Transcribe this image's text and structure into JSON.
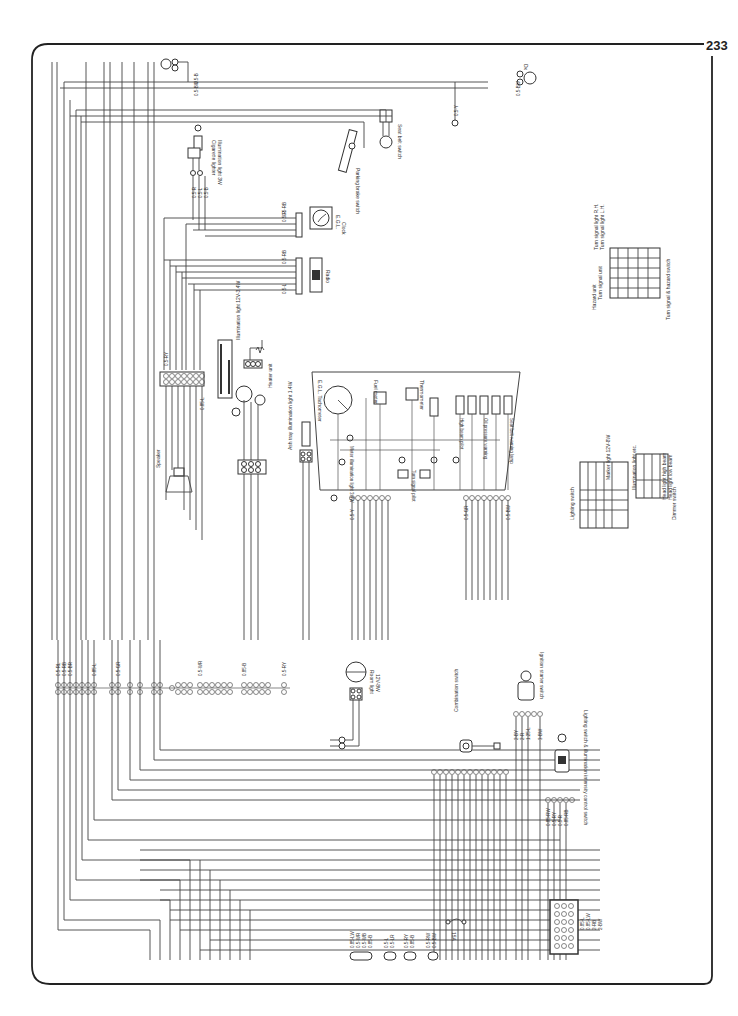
{
  "page": {
    "number": "233",
    "background": "#ffffff",
    "line_color": "#333333"
  },
  "components": {
    "cigarette_lighter": {
      "label": "Cigarette lighter",
      "sub": "Illumination light 3W"
    },
    "parking_brake": {
      "label": "Parking brake switch"
    },
    "seat_belt_switch": {
      "label": "Seat belt switch"
    },
    "door_switch": {
      "label": "Dx"
    },
    "clock": {
      "label": "Clock",
      "sub": "E.G.L."
    },
    "radio": {
      "label": "Radio"
    },
    "illumination_light": {
      "label": "Illumination light 12V-3.4W"
    },
    "heater_unit": {
      "label": "Heater unit"
    },
    "ash_tray": {
      "label": "Ash tray illumination light 1.4W"
    },
    "speaker": {
      "label": "Speaker"
    },
    "tachometer": {
      "label": "E.G.L. Tachometer"
    },
    "fuel_meter": {
      "label": "Fuel meter"
    },
    "thermometer": {
      "label": "Thermometer"
    },
    "meter_illumination": {
      "label": "Meter illumination light 3.4W"
    },
    "turn_signal_pilot": {
      "label": "Turn signal pilot"
    },
    "high_beam": {
      "label": "High beam pilot"
    },
    "oil_pressure": {
      "label": "Oil pressure warning"
    },
    "seat_belt_warning": {
      "label": "Seat belt warning lamp"
    },
    "room_light": {
      "label": "Room light",
      "sub": "12V-8W"
    },
    "combination_switch": {
      "label": "Combination switch"
    },
    "ignition_switch": {
      "label": "Ignition starter switch"
    },
    "lighting_switch": {
      "label": "Lighting switch & illumination intensity control switch"
    },
    "fuse": {
      "label": "15A"
    }
  },
  "tables": {
    "lighting_switch": {
      "title": "Lighting switch",
      "headers": [
        "Terminal",
        "B",
        "T",
        "H",
        "M",
        "L"
      ],
      "rows": [
        [
          "Color",
          "R/Y",
          "R",
          "RW",
          "RG",
          "LW"
        ],
        [
          "Pull OFF",
          "",
          "",
          "",
          "",
          ""
        ],
        [
          "ON",
          "",
          "",
          "",
          "",
          ""
        ]
      ],
      "notes": [
        "Marker light 12V-8W",
        "Illumination light etc."
      ]
    },
    "dimmer_switch": {
      "title": "Dimmer switch",
      "headers": [
        "Terminal",
        "RW",
        "RG",
        "RL"
      ],
      "rows": [
        [
          "Color",
          "",
          "",
          ""
        ],
        [
          "Lo",
          "",
          "",
          ""
        ],
        [
          "Hi",
          "",
          "",
          ""
        ]
      ],
      "notes": [
        "Head light high beam",
        "Head light low beam"
      ]
    },
    "turn_signal_hazard": {
      "title": "Turn signal & hazard switch",
      "headers": [
        "Terminal",
        "FU",
        "B",
        "FR",
        "FL"
      ],
      "rows": [
        [
          "Color",
          "GY",
          "GR",
          "GW",
          "GB"
        ],
        [
          "Turn signal R.H.",
          "",
          "",
          "",
          ""
        ],
        [
          "Turn signal L.H.",
          "",
          "",
          "",
          ""
        ],
        [
          "Hazard ON",
          "",
          "",
          "",
          ""
        ]
      ],
      "notes": [
        "Hazard unit",
        "Turn signal unit",
        "Turn signal light R.H.",
        "Turn signal light L.H."
      ]
    }
  },
  "wire_codes": {
    "top": [
      "0.5-B",
      "0.5-BW",
      "0.5-BR",
      "0.5-BW",
      "0.5-Y"
    ],
    "clock": [
      "0.5-RB",
      "0.5-R",
      "0.5-B",
      "0.5-B"
    ],
    "radio": [
      "0.5-RB",
      "0.5-R",
      "0.5-R",
      "0.5-B",
      "0.5-B",
      "0.5-B",
      "0.5-L"
    ],
    "lighter": [
      "0.5-R",
      "0.5-L",
      "0.5-B"
    ],
    "speaker_conn": [
      "0.5-RY",
      "0.5-W",
      "0.5-B",
      "0.5-R",
      "0.5-B",
      "0.5-RL",
      "0.85-L"
    ],
    "cluster_left": [
      "0.5-Y",
      "0.5-RB",
      "0.5-RL",
      "0.5-BY",
      "0.5-RB",
      "0.5-RY"
    ],
    "cluster_right": [
      "0.5-GR",
      "0.5-GW",
      "0.5-GB",
      "0.5-LR",
      "0.5-YR",
      "0.5-Y",
      "0.5-RW",
      "0.5-BW"
    ],
    "main_left": [
      "0.5-RL",
      "0.5-RB",
      "0.5-BR",
      "0.5-YR",
      "0.5-RB",
      "0.5-BR",
      "0.85-L",
      "0.5-RL",
      "0.5-GR",
      "0.5-B",
      "0.5-B",
      "0.5-BY",
      "0.5-RY"
    ],
    "main_right": [
      "0.85-B",
      "0.5-WR",
      "0.5-LY",
      "0.5-RY",
      "0.5-RB",
      "0.5-RW",
      "0.5-GB",
      "0.5-RL",
      "0.5-BR",
      "0.5-YR",
      "0.85-B",
      "0.85-L",
      "0.5-LY",
      "0.5-YR",
      "0.5-BY",
      "0.5-RY"
    ],
    "bottom_left": [
      "0.85-LW",
      "0.5-WR",
      "0.5-WB",
      "0.85-B"
    ],
    "bottom_mid": [
      "0.5-L",
      "0.5-LR"
    ],
    "bottom_mid2": [
      "0.5-RY",
      "0.85-B",
      "0.5-BY"
    ],
    "bottom_right": [
      "0.5-RW",
      "0.5-BW"
    ],
    "ignition": [
      "2-BY",
      "2-R",
      "1.25-L",
      "3-BW"
    ],
    "lighting": [
      "0.85-RW",
      "0.5-RY",
      "0.5-R",
      "0.85-RB",
      "0.5-LW"
    ],
    "fuse_block": [
      "0.85-L",
      "0.85-LW",
      "2-RB",
      "2-BW"
    ]
  }
}
